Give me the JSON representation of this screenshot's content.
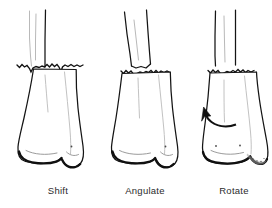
{
  "figure": {
    "background_color": "#ffffff",
    "ink_color": "#141414",
    "width": 272,
    "height": 208,
    "panel_count": 3
  },
  "panels": [
    {
      "id": "shift",
      "caption": "Shift",
      "caption_x": 58,
      "displacement": "translation",
      "description": "Proximal shaft translated sideways relative to distal fragment across a jagged transverse fracture",
      "has_arrow": false,
      "has_shading_patch": false
    },
    {
      "id": "angulate",
      "caption": "Angulate",
      "caption_x": 145,
      "displacement": "angulation",
      "description": "Proximal shaft tilted at an angle relative to distal fragment across a jagged transverse fracture",
      "has_arrow": false,
      "has_shading_patch": false
    },
    {
      "id": "rotate",
      "caption": "Rotate",
      "caption_x": 234,
      "displacement": "rotation",
      "description": "Distal fragment rotated about the long axis, shown by a curved arrow and a shaded articular surface",
      "has_arrow": true,
      "arrow_label": "rotation-arrow",
      "arrow_direction": "counter-clockwise",
      "has_shading_patch": true
    }
  ],
  "labels": {
    "shift": "Shift",
    "angulate": "Angulate",
    "rotate": "Rotate"
  }
}
